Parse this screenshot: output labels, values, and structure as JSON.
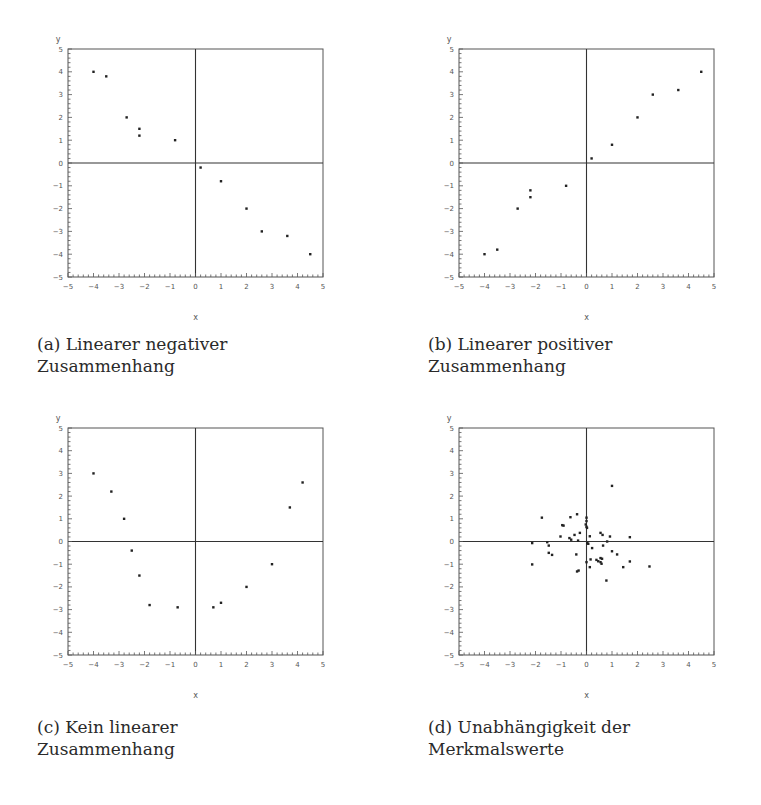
{
  "colors": {
    "frame": "#555555",
    "zero_lines": "#333333",
    "points": "#222222",
    "text": "#2a2a2a"
  },
  "captions": {
    "a": {
      "line1": "(a) Linearer negativer",
      "line2": "Zusammenhang"
    },
    "b": {
      "line1": "(b) Linearer positiver",
      "line2": "Zusammenhang"
    },
    "c": {
      "line1": "(c) Kein linearer",
      "line2": "Zusammenhang"
    },
    "d": {
      "line1": "(d) Unabhängigkeit der",
      "line2": "Merkmalswerte"
    }
  },
  "chart_data": [
    {
      "id": "a",
      "type": "scatter",
      "title": "(a) Linearer negativer Zusammenhang",
      "xlabel": "x",
      "ylabel": "y",
      "xlim": [
        -5,
        5
      ],
      "ylim": [
        -5,
        5
      ],
      "xticks": [
        -5,
        -4,
        -3,
        -2,
        -1,
        0,
        1,
        2,
        3,
        4,
        5
      ],
      "yticks": [
        -5,
        -4,
        -3,
        -2,
        -1,
        0,
        1,
        2,
        3,
        4,
        5
      ],
      "grid": false,
      "zero_lines": true,
      "points": [
        [
          -4,
          4
        ],
        [
          -3.5,
          3.8
        ],
        [
          -2.7,
          2
        ],
        [
          -2.2,
          1.5
        ],
        [
          -2.2,
          1.2
        ],
        [
          -0.8,
          1
        ],
        [
          0.2,
          -0.2
        ],
        [
          1,
          -0.8
        ],
        [
          2,
          -2
        ],
        [
          2.6,
          -3
        ],
        [
          3.6,
          -3.2
        ],
        [
          4.5,
          -4
        ]
      ]
    },
    {
      "id": "b",
      "type": "scatter",
      "title": "(b) Linearer positiver Zusammenhang",
      "xlabel": "x",
      "ylabel": "y",
      "xlim": [
        -5,
        5
      ],
      "ylim": [
        -5,
        5
      ],
      "xticks": [
        -5,
        -4,
        -3,
        -2,
        -1,
        0,
        1,
        2,
        3,
        4,
        5
      ],
      "yticks": [
        -5,
        -4,
        -3,
        -2,
        -1,
        0,
        1,
        2,
        3,
        4,
        5
      ],
      "grid": false,
      "zero_lines": true,
      "points": [
        [
          -4,
          -4
        ],
        [
          -3.5,
          -3.8
        ],
        [
          -2.7,
          -2
        ],
        [
          -2.2,
          -1.5
        ],
        [
          -2.2,
          -1.2
        ],
        [
          -0.8,
          -1
        ],
        [
          0.2,
          0.2
        ],
        [
          1,
          0.8
        ],
        [
          2,
          2
        ],
        [
          2.6,
          3
        ],
        [
          3.6,
          3.2
        ],
        [
          4.5,
          4
        ]
      ]
    },
    {
      "id": "c",
      "type": "scatter",
      "title": "(c) Kein linearer Zusammenhang",
      "xlabel": "x",
      "ylabel": "y",
      "xlim": [
        -5,
        5
      ],
      "ylim": [
        -5,
        5
      ],
      "xticks": [
        -5,
        -4,
        -3,
        -2,
        -1,
        0,
        1,
        2,
        3,
        4,
        5
      ],
      "yticks": [
        -5,
        -4,
        -3,
        -2,
        -1,
        0,
        1,
        2,
        3,
        4,
        5
      ],
      "grid": false,
      "zero_lines": true,
      "points": [
        [
          -4,
          3
        ],
        [
          -3.3,
          2.2
        ],
        [
          -2.8,
          1
        ],
        [
          -2.5,
          -0.4
        ],
        [
          -2.2,
          -1.5
        ],
        [
          -1.8,
          -2.8
        ],
        [
          -0.7,
          -2.9
        ],
        [
          0.7,
          -2.9
        ],
        [
          1,
          -2.7
        ],
        [
          2,
          -2
        ],
        [
          3,
          -1
        ],
        [
          3.7,
          1.5
        ],
        [
          4.2,
          2.6
        ]
      ]
    },
    {
      "id": "d",
      "type": "scatter",
      "title": "(d) Unabhängigkeit der Merkmalswerte",
      "xlabel": "x",
      "ylabel": "y",
      "xlim": [
        -5,
        5
      ],
      "ylim": [
        -5,
        5
      ],
      "xticks": [
        -5,
        -4,
        -3,
        -2,
        -1,
        0,
        1,
        2,
        3,
        4,
        5
      ],
      "yticks": [
        -5,
        -4,
        -3,
        -2,
        -1,
        0,
        1,
        2,
        3,
        4,
        5
      ],
      "grid": false,
      "zero_lines": true,
      "points": [
        [
          1.0,
          2.45
        ],
        [
          -1.75,
          1.05
        ],
        [
          -0.37,
          1.2
        ],
        [
          -0.63,
          1.07
        ],
        [
          -0.95,
          0.72
        ],
        [
          -0.9,
          0.7
        ],
        [
          0,
          1.05
        ],
        [
          0,
          0.9
        ],
        [
          -0.03,
          0.75
        ],
        [
          0,
          0.65
        ],
        [
          0.02,
          0.6
        ],
        [
          -1.02,
          0.22
        ],
        [
          -0.67,
          0.15
        ],
        [
          -0.6,
          0.08
        ],
        [
          -0.47,
          0.29
        ],
        [
          -0.26,
          0.38
        ],
        [
          -0.33,
          0.04
        ],
        [
          -2.13,
          -0.07
        ],
        [
          -1.54,
          -0.03
        ],
        [
          -1.48,
          -0.18
        ],
        [
          -1.48,
          -0.5
        ],
        [
          -1.35,
          -0.59
        ],
        [
          -2.13,
          -1.01
        ],
        [
          -0.4,
          -0.57
        ],
        [
          -0.31,
          -1.28
        ],
        [
          -0.37,
          -1.32
        ],
        [
          0.07,
          -0.1
        ],
        [
          0.03,
          -0.07
        ],
        [
          0.13,
          0.23
        ],
        [
          0.22,
          -0.29
        ],
        [
          0.55,
          0.38
        ],
        [
          0.63,
          0.29
        ],
        [
          0.92,
          0.22
        ],
        [
          0.81,
          0.0
        ],
        [
          0.65,
          -0.18
        ],
        [
          1.0,
          -0.43
        ],
        [
          1.2,
          -0.57
        ],
        [
          1.7,
          0.19
        ],
        [
          0.0,
          -0.91
        ],
        [
          0.16,
          -0.79
        ],
        [
          0.39,
          -0.81
        ],
        [
          0.46,
          -0.87
        ],
        [
          0.55,
          -0.73
        ],
        [
          0.61,
          -0.76
        ],
        [
          0.55,
          -0.91
        ],
        [
          0.59,
          -0.98
        ],
        [
          0.13,
          -1.13
        ],
        [
          0.78,
          -1.72
        ],
        [
          1.44,
          -1.13
        ],
        [
          1.7,
          -0.88
        ],
        [
          2.47,
          -1.1
        ]
      ]
    }
  ],
  "layout": {
    "panels": [
      {
        "id": "a",
        "frame": {
          "left": 68,
          "top": 49,
          "right": 323,
          "bottom": 277
        },
        "caption_pos": {
          "left": 37,
          "top": 333
        }
      },
      {
        "id": "b",
        "frame": {
          "left": 459,
          "top": 49,
          "right": 714,
          "bottom": 277
        },
        "caption_pos": {
          "left": 428,
          "top": 333
        }
      },
      {
        "id": "c",
        "frame": {
          "left": 68,
          "top": 428,
          "right": 323,
          "bottom": 655
        },
        "caption_pos": {
          "left": 37,
          "top": 716
        }
      },
      {
        "id": "d",
        "frame": {
          "left": 459,
          "top": 428,
          "right": 714,
          "bottom": 655
        },
        "caption_pos": {
          "left": 428,
          "top": 716
        }
      }
    ]
  }
}
